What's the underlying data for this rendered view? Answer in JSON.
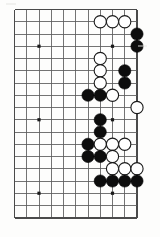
{
  "figure": {
    "kind": "go-board-diagram",
    "caption": "",
    "board": {
      "cols": 11,
      "rows": 18,
      "left_px": 14.5,
      "top_px": 9.5,
      "cell_px": 12.25,
      "line_color": "#5b5b5b",
      "border_color": "#4a4a4a",
      "background_color": "#fdfdfc",
      "stone_radius_px": 6.1
    },
    "star_points": [
      {
        "col": 2,
        "row": 3
      },
      {
        "col": 8,
        "row": 3
      },
      {
        "col": 2,
        "row": 9
      },
      {
        "col": 8,
        "row": 9
      },
      {
        "col": 2,
        "row": 15
      },
      {
        "col": 8,
        "row": 15
      }
    ],
    "stones": [
      {
        "col": 7,
        "row": 1,
        "color": "white"
      },
      {
        "col": 8,
        "row": 1,
        "color": "white"
      },
      {
        "col": 9,
        "row": 1,
        "color": "white"
      },
      {
        "col": 10,
        "row": 2,
        "color": "black"
      },
      {
        "col": 10,
        "row": 3,
        "color": "black"
      },
      {
        "col": 7,
        "row": 4,
        "color": "white"
      },
      {
        "col": 7,
        "row": 5,
        "color": "white"
      },
      {
        "col": 9,
        "row": 5,
        "color": "black"
      },
      {
        "col": 7,
        "row": 6,
        "color": "white"
      },
      {
        "col": 9,
        "row": 6,
        "color": "black"
      },
      {
        "col": 6,
        "row": 7,
        "color": "black"
      },
      {
        "col": 7,
        "row": 7,
        "color": "black"
      },
      {
        "col": 8,
        "row": 7,
        "color": "white"
      },
      {
        "col": 10,
        "row": 8,
        "color": "white"
      },
      {
        "col": 7,
        "row": 9,
        "color": "black"
      },
      {
        "col": 7,
        "row": 10,
        "color": "black"
      },
      {
        "col": 6,
        "row": 11,
        "color": "black"
      },
      {
        "col": 7,
        "row": 11,
        "color": "white"
      },
      {
        "col": 8,
        "row": 11,
        "color": "white"
      },
      {
        "col": 9,
        "row": 11,
        "color": "white"
      },
      {
        "col": 6,
        "row": 12,
        "color": "black"
      },
      {
        "col": 7,
        "row": 12,
        "color": "black"
      },
      {
        "col": 8,
        "row": 12,
        "color": "white"
      },
      {
        "col": 8,
        "row": 13,
        "color": "white"
      },
      {
        "col": 9,
        "row": 13,
        "color": "white"
      },
      {
        "col": 10,
        "row": 13,
        "color": "white"
      },
      {
        "col": 7,
        "row": 14,
        "color": "black"
      },
      {
        "col": 8,
        "row": 14,
        "color": "black"
      },
      {
        "col": 9,
        "row": 14,
        "color": "black"
      },
      {
        "col": 10,
        "row": 14,
        "color": "black"
      }
    ],
    "colors": {
      "black_stone": "#0d0d0d",
      "white_stone": "#ffffff",
      "white_stone_outline": "#1a1a1a"
    }
  }
}
